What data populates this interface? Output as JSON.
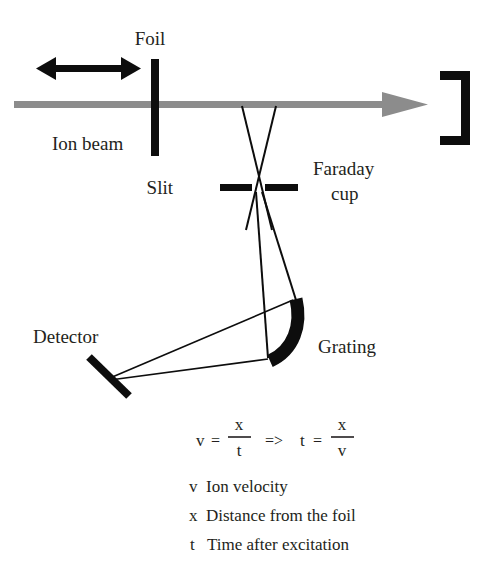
{
  "figure": {
    "title_visible": false,
    "labels": {
      "foil": "Foil",
      "ion_beam": "Ion beam",
      "slit": "Slit",
      "faraday_cup_line1": "Faraday",
      "faraday_cup_line2": "cup",
      "detector": "Detector",
      "grating": "Grating"
    },
    "formula": {
      "v": "v",
      "eq1": "=",
      "num1": "x",
      "den1": "t",
      "implies": "=>",
      "t": "t",
      "eq2": "=",
      "num2": "x",
      "den2": "v"
    },
    "legend": [
      {
        "symbol": "v",
        "text": "Ion velocity"
      },
      {
        "symbol": "x",
        "text": "Distance from the foil"
      },
      {
        "symbol": "t",
        "text": "Time after excitation"
      }
    ],
    "colors": {
      "ink": "#231f20",
      "beam_gray": "#8c8c8c",
      "background": "#ffffff"
    },
    "icons": {
      "double_arrow": "double-headed-arrow",
      "beam_arrow": "right-arrow",
      "faraday_bracket": "bracket-right",
      "grating_arc": "concave-arc",
      "detector_bar": "tilted-bar"
    }
  }
}
